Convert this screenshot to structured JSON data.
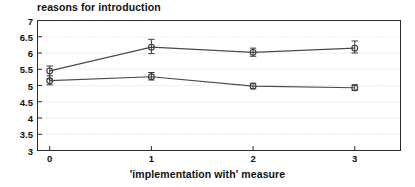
{
  "chart_data": {
    "type": "line",
    "title": "reasons for introduction",
    "xlabel": "'implementation with' measure",
    "ylabel": "",
    "x": [
      0,
      1,
      2,
      3
    ],
    "xtick_labels": [
      "0",
      "1",
      "2",
      "3"
    ],
    "ytick_labels": [
      "3",
      "3.5",
      "4",
      "4.5",
      "5",
      "5.5",
      "6",
      "6.5",
      "7"
    ],
    "ytick_values": [
      3,
      3.5,
      4,
      4.5,
      5,
      5.5,
      6,
      6.5,
      7
    ],
    "xlim": [
      -0.12,
      3.45
    ],
    "ylim": [
      3,
      7
    ],
    "grid": true,
    "legend": "none",
    "marker": "circle-with-errorbar",
    "series": [
      {
        "name": "upper-series",
        "values": [
          5.45,
          6.18,
          6.02,
          6.15
        ],
        "error_low": [
          5.2,
          5.98,
          5.9,
          6.0
        ],
        "error_high": [
          5.6,
          6.42,
          6.15,
          6.37
        ]
      },
      {
        "name": "lower-series",
        "values": [
          5.15,
          5.27,
          4.98,
          4.93
        ],
        "error_low": [
          5.02,
          5.17,
          4.9,
          4.85
        ],
        "error_high": [
          5.3,
          5.4,
          5.07,
          5.02
        ]
      }
    ],
    "colors": {
      "line": "#4a4a4a",
      "marker": "#3a3a3a",
      "axis": "#2b2b2b",
      "grid": "#c9c9c9",
      "background": "#ffffff",
      "text": "#121212"
    }
  }
}
